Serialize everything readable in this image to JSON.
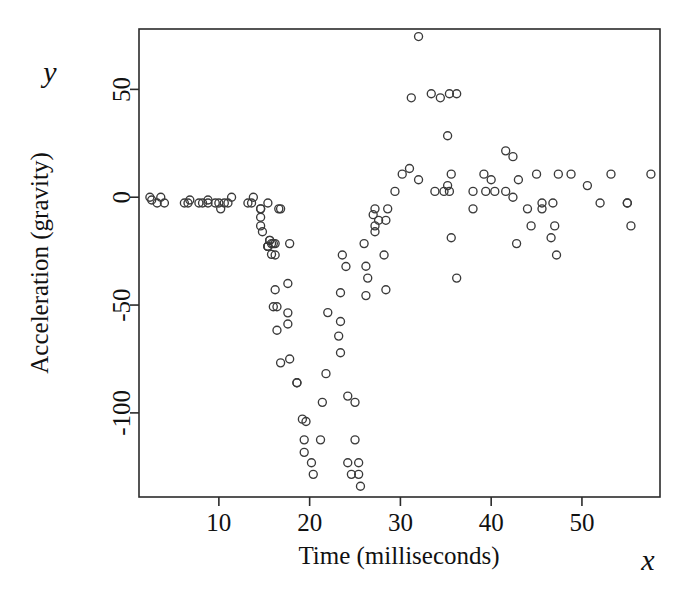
{
  "figure": {
    "background_color": "#ffffff",
    "frame_color": "#2b2b2b",
    "marker_color": "#3a3a3a",
    "y_var_label": "y",
    "x_var_label": "x"
  },
  "chart_data": {
    "type": "scatter",
    "title": "",
    "xlabel": "Time (milliseconds)",
    "ylabel": "Acceleration (gravity)",
    "xlim": [
      1.2,
      58.6
    ],
    "ylim": [
      -139,
      78
    ],
    "grid": false,
    "legend": null,
    "xticks": [
      10,
      20,
      30,
      40,
      50
    ],
    "xticklabels": [
      "10",
      "20",
      "30",
      "40",
      "50"
    ],
    "yticks": [
      50,
      0,
      -50,
      -100
    ],
    "yticklabels": [
      "50",
      "0",
      "-50",
      "-100"
    ],
    "marker": "open-circle",
    "marker_size": 8,
    "points": [
      [
        2.4,
        0.0
      ],
      [
        2.6,
        -1.3
      ],
      [
        3.2,
        -2.7
      ],
      [
        3.6,
        0.0
      ],
      [
        4.0,
        -2.7
      ],
      [
        6.2,
        -2.7
      ],
      [
        6.6,
        -2.7
      ],
      [
        6.8,
        -1.3
      ],
      [
        7.8,
        -2.7
      ],
      [
        8.2,
        -2.7
      ],
      [
        8.8,
        -1.3
      ],
      [
        8.8,
        -2.7
      ],
      [
        9.6,
        -2.7
      ],
      [
        10.0,
        -2.7
      ],
      [
        10.2,
        -5.4
      ],
      [
        10.6,
        -2.7
      ],
      [
        11.0,
        -2.7
      ],
      [
        11.4,
        0.0
      ],
      [
        13.2,
        -2.7
      ],
      [
        13.6,
        -2.7
      ],
      [
        13.8,
        0.0
      ],
      [
        14.6,
        -13.3
      ],
      [
        14.6,
        -5.4
      ],
      [
        14.6,
        -5.4
      ],
      [
        14.6,
        -9.3
      ],
      [
        14.8,
        -16.0
      ],
      [
        15.4,
        -22.8
      ],
      [
        15.4,
        -2.7
      ],
      [
        15.4,
        -22.8
      ],
      [
        15.4,
        -22.8
      ],
      [
        15.6,
        -20.0
      ],
      [
        15.6,
        -20.0
      ],
      [
        15.8,
        -26.5
      ],
      [
        15.8,
        -21.5
      ],
      [
        16.0,
        -21.5
      ],
      [
        16.0,
        -50.8
      ],
      [
        16.2,
        -42.9
      ],
      [
        16.2,
        -26.8
      ],
      [
        16.2,
        -21.5
      ],
      [
        16.4,
        -50.8
      ],
      [
        16.4,
        -61.7
      ],
      [
        16.6,
        -5.4
      ],
      [
        16.8,
        -76.8
      ],
      [
        16.8,
        -5.4
      ],
      [
        17.6,
        -58.8
      ],
      [
        17.6,
        -53.6
      ],
      [
        17.6,
        -40.0
      ],
      [
        17.8,
        -21.5
      ],
      [
        17.8,
        -75.0
      ],
      [
        18.6,
        -86.0
      ],
      [
        18.6,
        -86.0
      ],
      [
        19.2,
        -102.9
      ],
      [
        19.4,
        -112.5
      ],
      [
        19.4,
        -118.3
      ],
      [
        19.6,
        -104.0
      ],
      [
        20.2,
        -123.1
      ],
      [
        20.4,
        -128.5
      ],
      [
        21.2,
        -112.5
      ],
      [
        21.4,
        -95.1
      ],
      [
        21.8,
        -81.8
      ],
      [
        22.0,
        -53.5
      ],
      [
        23.2,
        -64.4
      ],
      [
        23.4,
        -57.6
      ],
      [
        23.4,
        -72.1
      ],
      [
        23.4,
        -44.3
      ],
      [
        23.6,
        -26.8
      ],
      [
        24.0,
        -32.1
      ],
      [
        24.2,
        -123.1
      ],
      [
        24.2,
        -92.2
      ],
      [
        24.6,
        -128.5
      ],
      [
        25.0,
        -112.5
      ],
      [
        25.0,
        -95.1
      ],
      [
        25.4,
        -128.5
      ],
      [
        25.4,
        -123.1
      ],
      [
        25.6,
        -134.0
      ],
      [
        26.0,
        -21.5
      ],
      [
        26.2,
        -32.0
      ],
      [
        26.2,
        -45.6
      ],
      [
        26.4,
        -37.5
      ],
      [
        27.0,
        -8.1
      ],
      [
        27.2,
        -13.3
      ],
      [
        27.2,
        -5.4
      ],
      [
        27.2,
        -16.0
      ],
      [
        27.6,
        -10.7
      ],
      [
        28.2,
        -26.8
      ],
      [
        28.4,
        -10.7
      ],
      [
        28.4,
        -42.9
      ],
      [
        28.6,
        -5.4
      ],
      [
        29.4,
        2.7
      ],
      [
        30.2,
        10.7
      ],
      [
        31.0,
        13.3
      ],
      [
        31.2,
        46.1
      ],
      [
        32.0,
        74.5
      ],
      [
        32.0,
        8.1
      ],
      [
        33.4,
        48.0
      ],
      [
        33.8,
        2.7
      ],
      [
        34.4,
        46.1
      ],
      [
        34.8,
        2.7
      ],
      [
        35.2,
        5.4
      ],
      [
        35.2,
        28.5
      ],
      [
        35.4,
        2.7
      ],
      [
        35.4,
        48.0
      ],
      [
        35.6,
        -18.8
      ],
      [
        35.6,
        10.7
      ],
      [
        36.2,
        48.0
      ],
      [
        36.2,
        -37.5
      ],
      [
        38.0,
        2.7
      ],
      [
        38.0,
        -5.4
      ],
      [
        39.2,
        10.7
      ],
      [
        39.4,
        2.7
      ],
      [
        40.0,
        8.1
      ],
      [
        40.4,
        2.7
      ],
      [
        41.6,
        21.5
      ],
      [
        41.6,
        2.7
      ],
      [
        42.4,
        18.8
      ],
      [
        42.4,
        0.0
      ],
      [
        42.8,
        -21.5
      ],
      [
        43.0,
        8.1
      ],
      [
        44.0,
        -5.4
      ],
      [
        44.4,
        -13.3
      ],
      [
        45.0,
        10.7
      ],
      [
        45.6,
        -2.7
      ],
      [
        45.6,
        -5.4
      ],
      [
        46.6,
        -18.8
      ],
      [
        46.8,
        -2.7
      ],
      [
        47.0,
        -13.3
      ],
      [
        47.2,
        -26.8
      ],
      [
        47.4,
        10.7
      ],
      [
        48.8,
        10.7
      ],
      [
        50.6,
        5.4
      ],
      [
        52.0,
        -2.7
      ],
      [
        53.2,
        10.7
      ],
      [
        55.0,
        -2.7
      ],
      [
        55.0,
        -2.7
      ],
      [
        55.4,
        -13.3
      ],
      [
        57.6,
        10.7
      ]
    ]
  }
}
